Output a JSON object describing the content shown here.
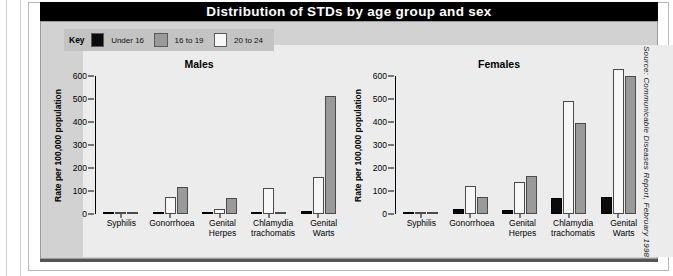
{
  "title": "Distribution of STDs by age group and sex",
  "legend": {
    "key_label": "Key",
    "items": [
      {
        "label": "Under 16",
        "color": "#0b0b0b"
      },
      {
        "label": "16 to 19",
        "color": "#9a9a9a"
      },
      {
        "label": "20 to 24",
        "color": "#f7f7f7"
      }
    ]
  },
  "source_note": "Source: Communicable Diseases Report, February 1998",
  "chart_data": [
    {
      "type": "bar",
      "title": "Males",
      "xlabel": "",
      "ylabel": "Rate per 100,000 population",
      "ylim": [
        0,
        600
      ],
      "yticks": [
        0,
        100,
        200,
        300,
        400,
        500,
        600
      ],
      "grid": false,
      "legend_position": "top-left-external",
      "categories": [
        "Syphilis",
        "Gonorrhoea",
        "Genital Herpes",
        "Chlamydia trachomatis",
        "Genital Warts"
      ],
      "series": [
        {
          "name": "Under 16",
          "color": "#0b0b0b",
          "values": [
            1,
            4,
            3,
            5,
            13
          ]
        },
        {
          "name": "20 to 24",
          "color": "#f7f7f7",
          "values": [
            1,
            73,
            20,
            111,
            159
          ]
        },
        {
          "name": "16 to 19",
          "color": "#9a9a9a",
          "values": [
            1,
            117,
            71,
            3,
            515
          ]
        }
      ]
    },
    {
      "type": "bar",
      "title": "Females",
      "xlabel": "",
      "ylabel": "Rate per 100,000 population",
      "ylim": [
        0,
        600
      ],
      "yticks": [
        0,
        100,
        200,
        300,
        400,
        500,
        600
      ],
      "grid": false,
      "legend_position": "top-left-external",
      "categories": [
        "Syphilis",
        "Gonorrhoea",
        "Genital Herpes",
        "Chlamydia trachomatis",
        "Genital Warts"
      ],
      "series": [
        {
          "name": "Under 16",
          "color": "#0b0b0b",
          "values": [
            1,
            20,
            17,
            70,
            73
          ]
        },
        {
          "name": "20 to 24",
          "color": "#f7f7f7",
          "values": [
            1,
            120,
            139,
            491,
            632
          ]
        },
        {
          "name": "16 to 19",
          "color": "#9a9a9a",
          "values": [
            1,
            75,
            166,
            397,
            601
          ]
        }
      ]
    }
  ]
}
